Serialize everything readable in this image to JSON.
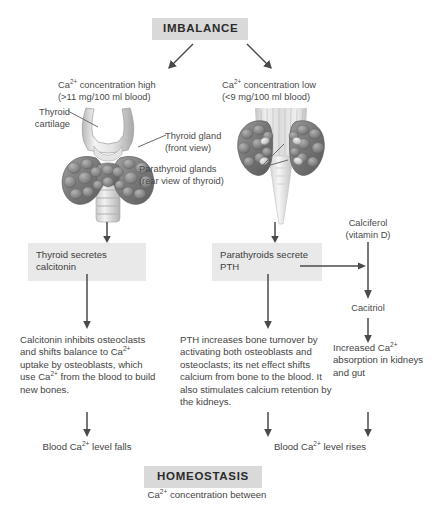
{
  "diagram": {
    "title_top": "IMBALANCE",
    "title_bottom": "HOMEOSTASIS",
    "bottom_caption": "Ca2+ concentration between"
  },
  "branches": {
    "left": {
      "condition_line1": "Ca2+ concentration high",
      "condition_line2": "(>11 mg/100 ml blood)",
      "gland_box": "Thyroid secretes calcitonin",
      "effect_text": "Calcitonin inhibits osteoclasts and shifts balance to Ca2+ uptake by osteoblasts, which use Ca2+ from the blood to build new bones.",
      "outcome": "Blood Ca2+ level falls"
    },
    "right": {
      "condition_line1": "Ca2+ concentration low",
      "condition_line2": "(<9 mg/100 ml blood)",
      "gland_box": "Parathyroids secrete PTH",
      "effect_text": "PTH increases bone turnover by activating both osteoblasts and osteoclasts; its net effect shifts calcium from bone to the blood. It also stimulates calcium retention by the kidneys.",
      "outcome": "Blood Ca2+ level rises"
    },
    "far_right": {
      "source_line1": "Calciferol",
      "source_line2": "(vitamin D)",
      "intermediate": "Cacitriol",
      "effect_text": "Increased Ca2+ absorption in kidneys and gut"
    }
  },
  "anatomy": {
    "label_thyroid_cartilage_line1": "Thyroid",
    "label_thyroid_cartilage_line2": "cartilage",
    "label_thyroid_gland_line1": "Thyroid gland",
    "label_thyroid_gland_line2": "(front view)",
    "label_parathyroid_line1": "Parathyroid glands",
    "label_parathyroid_line2": "(rear view of thyroid)"
  },
  "colors": {
    "header_box_bg": "#d9d9d9",
    "grey_box_bg": "#e9e9e9",
    "line": "#4a4a4a",
    "text": "#3d3d3d",
    "gland_dark": "#6f6f6f",
    "gland_light": "#cfcfcf"
  }
}
